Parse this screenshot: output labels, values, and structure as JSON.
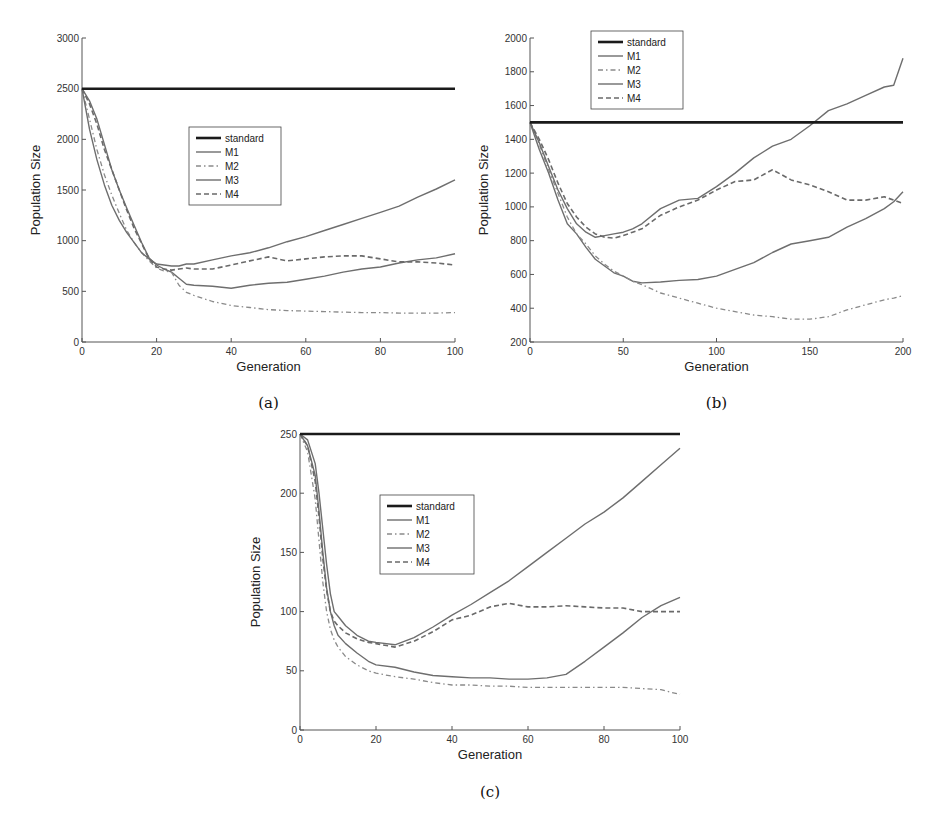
{
  "figure": {
    "legend_labels": [
      "standard",
      "M1",
      "M2",
      "M3",
      "M4"
    ]
  },
  "chart_data": [
    {
      "id": "a",
      "type": "line",
      "caption": "(a)",
      "xlabel": "Generation",
      "ylabel": "Population Size",
      "xlim": [
        0,
        100
      ],
      "ylim": [
        0,
        3000
      ],
      "xticks": [
        0,
        20,
        40,
        60,
        80,
        100
      ],
      "yticks": [
        0,
        500,
        1000,
        1500,
        2000,
        2500,
        3000
      ],
      "legend_position": "center",
      "grid": false,
      "x": [
        0,
        2,
        4,
        6,
        8,
        10,
        12,
        14,
        16,
        18,
        20,
        22,
        24,
        26,
        28,
        30,
        35,
        40,
        45,
        50,
        55,
        60,
        65,
        70,
        75,
        80,
        85,
        90,
        95,
        100
      ],
      "series": [
        {
          "name": "standard",
          "style": "solid-thick",
          "values": [
            2500,
            2500,
            2500,
            2500,
            2500,
            2500,
            2500,
            2500,
            2500,
            2500,
            2500,
            2500,
            2500,
            2500,
            2500,
            2500,
            2500,
            2500,
            2500,
            2500,
            2500,
            2500,
            2500,
            2500,
            2500,
            2500,
            2500,
            2500,
            2500,
            2500
          ]
        },
        {
          "name": "M1",
          "style": "solid",
          "values": [
            2500,
            2380,
            2200,
            1950,
            1700,
            1500,
            1320,
            1150,
            980,
            830,
            760,
            720,
            690,
            630,
            570,
            560,
            550,
            530,
            560,
            580,
            590,
            620,
            650,
            690,
            720,
            740,
            780,
            810,
            830,
            870
          ]
        },
        {
          "name": "M2",
          "style": "dashdot",
          "values": [
            2500,
            2200,
            1900,
            1650,
            1450,
            1270,
            1100,
            980,
            880,
            800,
            730,
            700,
            690,
            560,
            490,
            460,
            400,
            360,
            340,
            320,
            310,
            305,
            300,
            295,
            290,
            290,
            285,
            285,
            285,
            290
          ]
        },
        {
          "name": "M3",
          "style": "solid",
          "values": [
            2500,
            2100,
            1800,
            1550,
            1350,
            1200,
            1080,
            980,
            880,
            820,
            770,
            760,
            750,
            750,
            770,
            770,
            810,
            850,
            880,
            930,
            990,
            1040,
            1100,
            1160,
            1220,
            1280,
            1340,
            1430,
            1510,
            1600
          ]
        },
        {
          "name": "M4",
          "style": "dashed",
          "values": [
            2500,
            2350,
            2150,
            1900,
            1700,
            1500,
            1300,
            1120,
            970,
            820,
            740,
            720,
            710,
            720,
            730,
            720,
            720,
            760,
            800,
            840,
            800,
            820,
            840,
            850,
            850,
            820,
            790,
            790,
            780,
            760
          ]
        }
      ]
    },
    {
      "id": "b",
      "type": "line",
      "caption": "(b)",
      "xlabel": "Generation",
      "ylabel": "Population Size",
      "xlim": [
        0,
        200
      ],
      "ylim": [
        200,
        2000
      ],
      "xticks": [
        0,
        50,
        100,
        150,
        200
      ],
      "yticks": [
        200,
        400,
        600,
        800,
        1000,
        1200,
        1400,
        1600,
        1800,
        2000
      ],
      "legend_position": "upper left",
      "grid": false,
      "x": [
        0,
        5,
        10,
        15,
        20,
        25,
        30,
        35,
        40,
        45,
        50,
        55,
        60,
        70,
        80,
        90,
        100,
        110,
        120,
        130,
        140,
        150,
        160,
        170,
        180,
        190,
        195,
        200
      ],
      "series": [
        {
          "name": "standard",
          "style": "solid-thick",
          "values": [
            1500,
            1500,
            1500,
            1500,
            1500,
            1500,
            1500,
            1500,
            1500,
            1500,
            1500,
            1500,
            1500,
            1500,
            1500,
            1500,
            1500,
            1500,
            1500,
            1500,
            1500,
            1500,
            1500,
            1500,
            1500,
            1500,
            1500,
            1500
          ]
        },
        {
          "name": "M1",
          "style": "solid",
          "values": [
            1500,
            1340,
            1200,
            1040,
            900,
            840,
            760,
            690,
            650,
            610,
            590,
            560,
            550,
            555,
            565,
            570,
            590,
            630,
            670,
            730,
            780,
            800,
            820,
            880,
            930,
            990,
            1030,
            1090
          ]
        },
        {
          "name": "M2",
          "style": "dashdot",
          "values": [
            1500,
            1370,
            1220,
            1080,
            940,
            840,
            780,
            710,
            660,
            620,
            590,
            560,
            540,
            490,
            460,
            430,
            400,
            380,
            360,
            350,
            335,
            335,
            350,
            390,
            420,
            450,
            460,
            475
          ]
        },
        {
          "name": "M3",
          "style": "solid",
          "values": [
            1500,
            1380,
            1240,
            1100,
            990,
            900,
            850,
            820,
            830,
            840,
            850,
            870,
            900,
            990,
            1040,
            1050,
            1120,
            1200,
            1290,
            1360,
            1400,
            1480,
            1570,
            1610,
            1660,
            1710,
            1720,
            1880
          ]
        },
        {
          "name": "M4",
          "style": "dashed",
          "values": [
            1500,
            1400,
            1280,
            1140,
            1020,
            940,
            880,
            840,
            820,
            815,
            830,
            850,
            870,
            950,
            1000,
            1040,
            1100,
            1150,
            1160,
            1220,
            1160,
            1130,
            1090,
            1040,
            1040,
            1060,
            1040,
            1020
          ]
        }
      ]
    },
    {
      "id": "c",
      "type": "line",
      "caption": "(c)",
      "xlabel": "Generation",
      "ylabel": "Population Size",
      "xlim": [
        0,
        100
      ],
      "ylim": [
        0,
        250
      ],
      "xticks": [
        0,
        20,
        40,
        60,
        80,
        100
      ],
      "yticks": [
        0,
        50,
        100,
        150,
        200,
        250
      ],
      "legend_position": "center",
      "grid": false,
      "x": [
        0,
        2,
        4,
        5,
        6,
        7,
        8,
        9,
        10,
        12,
        15,
        18,
        20,
        25,
        30,
        35,
        40,
        45,
        50,
        55,
        60,
        65,
        70,
        75,
        80,
        85,
        90,
        95,
        100
      ],
      "series": [
        {
          "name": "standard",
          "style": "solid-thick",
          "values": [
            250,
            250,
            250,
            250,
            250,
            250,
            250,
            250,
            250,
            250,
            250,
            250,
            250,
            250,
            250,
            250,
            250,
            250,
            250,
            250,
            250,
            250,
            250,
            250,
            250,
            250,
            250,
            250,
            250
          ]
        },
        {
          "name": "M1",
          "style": "solid",
          "values": [
            250,
            240,
            215,
            185,
            150,
            120,
            100,
            88,
            80,
            73,
            65,
            58,
            55,
            53,
            49,
            46,
            45,
            44,
            44,
            43,
            43,
            44,
            47,
            58,
            70,
            82,
            95,
            105,
            112
          ]
        },
        {
          "name": "M2",
          "style": "dashdot",
          "values": [
            250,
            235,
            195,
            160,
            125,
            100,
            85,
            76,
            70,
            62,
            55,
            50,
            48,
            45,
            43,
            40,
            38,
            38,
            37,
            37,
            36,
            36,
            36,
            36,
            36,
            36,
            35,
            34,
            30
          ]
        },
        {
          "name": "M3",
          "style": "solid",
          "values": [
            250,
            245,
            225,
            200,
            170,
            140,
            115,
            100,
            96,
            88,
            80,
            75,
            74,
            72,
            78,
            87,
            97,
            106,
            116,
            126,
            138,
            150,
            162,
            174,
            184,
            196,
            210,
            224,
            238
          ]
        },
        {
          "name": "M4",
          "style": "dashed",
          "values": [
            250,
            240,
            210,
            180,
            145,
            118,
            100,
            92,
            88,
            82,
            77,
            74,
            73,
            70,
            75,
            83,
            93,
            97,
            104,
            107,
            104,
            104,
            105,
            104,
            103,
            103,
            100,
            100,
            100
          ]
        }
      ]
    }
  ]
}
